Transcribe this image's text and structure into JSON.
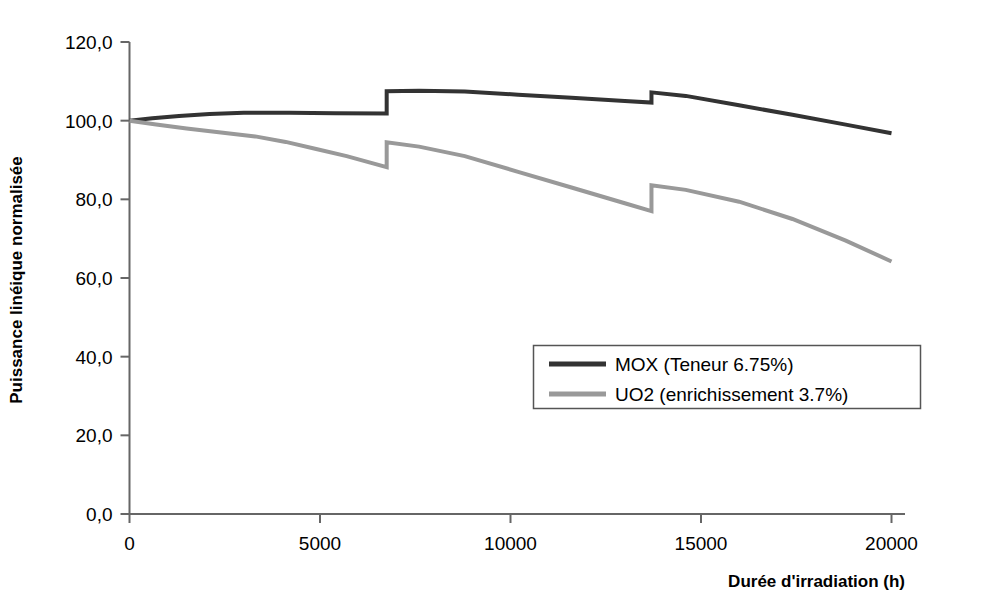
{
  "chart_data": {
    "type": "line",
    "title": "",
    "xlabel": "Durée d'irradiation (h)",
    "ylabel": "Puissance linéique normalisée",
    "xlim": [
      0,
      21000
    ],
    "ylim": [
      0,
      120
    ],
    "xticks": [
      0,
      5000,
      10000,
      15000,
      20000
    ],
    "xtick_labels": [
      "0",
      "5000",
      "10000",
      "15000",
      "20000"
    ],
    "yticks": [
      0,
      20,
      40,
      60,
      80,
      100,
      120
    ],
    "ytick_labels": [
      "0,0",
      "20,0",
      "40,0",
      "60,0",
      "80,0",
      "100,0",
      "120,0"
    ],
    "grid": false,
    "legend_position": "center-right",
    "cycle_boundaries": [
      6750,
      13700
    ],
    "series": [
      {
        "name": "MOX (Teneur 6.75%)",
        "color": "#333333",
        "linewidth": 4,
        "points": [
          [
            0,
            100.0
          ],
          [
            600,
            100.6
          ],
          [
            1300,
            101.2
          ],
          [
            2100,
            101.7
          ],
          [
            3000,
            102.0
          ],
          [
            4200,
            102.0
          ],
          [
            5400,
            101.9
          ],
          [
            6750,
            101.8
          ],
          [
            6750,
            107.5
          ],
          [
            7600,
            107.6
          ],
          [
            8800,
            107.4
          ],
          [
            10200,
            106.6
          ],
          [
            11600,
            105.8
          ],
          [
            13000,
            105.0
          ],
          [
            13700,
            104.6
          ],
          [
            13700,
            107.2
          ],
          [
            14600,
            106.3
          ],
          [
            16000,
            103.9
          ],
          [
            17400,
            101.5
          ],
          [
            18800,
            99.0
          ],
          [
            20000,
            96.8
          ]
        ]
      },
      {
        "name": "UO2 (enrichissement 3.7%)",
        "color": "#999999",
        "linewidth": 4,
        "points": [
          [
            0,
            100.0
          ],
          [
            700,
            99.0
          ],
          [
            1500,
            98.0
          ],
          [
            2400,
            97.0
          ],
          [
            3300,
            96.0
          ],
          [
            4100,
            94.6
          ],
          [
            4900,
            92.8
          ],
          [
            5700,
            91.0
          ],
          [
            6750,
            88.2
          ],
          [
            6750,
            94.5
          ],
          [
            7600,
            93.4
          ],
          [
            8800,
            91.0
          ],
          [
            10200,
            87.0
          ],
          [
            11600,
            83.0
          ],
          [
            13000,
            79.0
          ],
          [
            13700,
            77.0
          ],
          [
            13700,
            83.6
          ],
          [
            14600,
            82.4
          ],
          [
            16000,
            79.4
          ],
          [
            17400,
            75.0
          ],
          [
            18800,
            69.5
          ],
          [
            20000,
            64.2
          ]
        ]
      }
    ]
  }
}
